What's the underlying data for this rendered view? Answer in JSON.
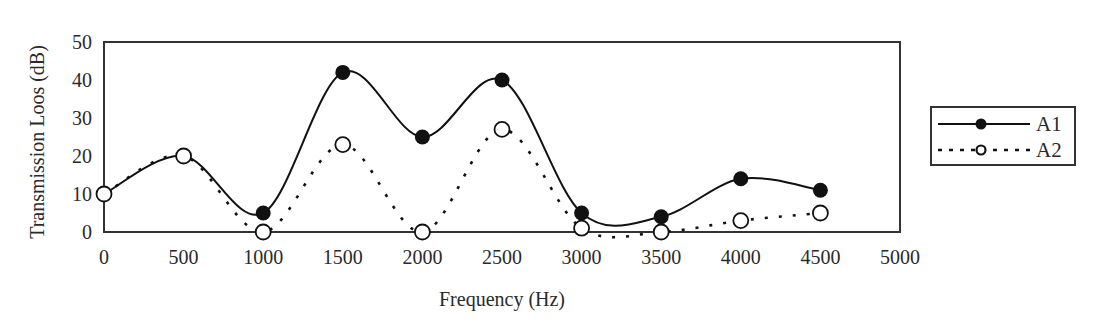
{
  "chart_data": {
    "type": "line",
    "title": "",
    "xlabel": "Frequency (Hz)",
    "ylabel": "Transmission Loos (dB)",
    "xlim": [
      0,
      5000
    ],
    "ylim": [
      0,
      50
    ],
    "x_ticks": [
      0,
      500,
      1000,
      1500,
      2000,
      2500,
      3000,
      3500,
      4000,
      4500,
      5000
    ],
    "y_ticks": [
      0,
      10,
      20,
      30,
      40,
      50
    ],
    "grid": false,
    "smooth": true,
    "legend_position": "right",
    "x": [
      0,
      500,
      1000,
      1500,
      2000,
      2500,
      3000,
      3500,
      4000,
      4500
    ],
    "series": [
      {
        "name": "A1",
        "line_style": "solid",
        "marker": "filled-circle",
        "color": "#111111",
        "values": [
          10,
          20,
          5,
          42,
          25,
          40,
          5,
          4,
          14,
          11
        ]
      },
      {
        "name": "A2",
        "line_style": "dotted",
        "marker": "open-circle",
        "color": "#111111",
        "values": [
          10,
          20,
          0,
          23,
          0,
          27,
          1,
          0,
          3,
          5
        ]
      }
    ]
  }
}
